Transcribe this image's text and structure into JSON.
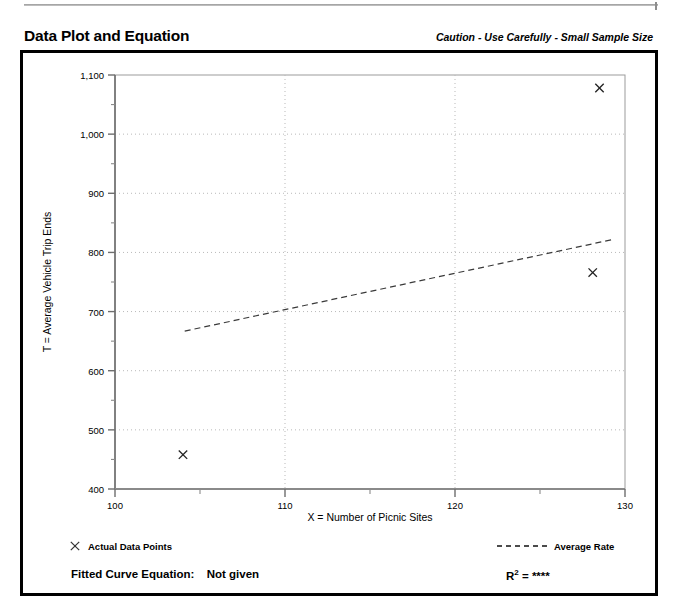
{
  "header": {
    "title": "Data Plot and Equation",
    "caution": "Caution - Use Carefully - Small Sample Size"
  },
  "footer": {
    "equation_label": "Fitted Curve Equation:",
    "equation_value": "Not given",
    "r2_symbol": "R",
    "r2_exponent": "2",
    "r2_equals": "=",
    "r2_value": "****"
  },
  "legend": {
    "data_points_label": "Actual Data Points",
    "data_points_marker": "x-marker-icon",
    "average_rate_label": "Average Rate",
    "average_rate_marker": "dashed-line-icon"
  },
  "chart_data": {
    "type": "scatter",
    "title": "Data Plot and Equation",
    "xlabel": "X = Number of Picnic Sites",
    "ylabel": "T = Average Vehicle Trip Ends",
    "xlim": [
      100,
      130
    ],
    "ylim": [
      400,
      1100
    ],
    "xticks": [
      100,
      110,
      120,
      130
    ],
    "xtick_labels": [
      "100",
      "110",
      "120",
      "130"
    ],
    "xminor_ticks": [
      105,
      115,
      125
    ],
    "yticks": [
      400,
      500,
      600,
      700,
      800,
      900,
      1000,
      1100
    ],
    "ytick_labels": [
      "400",
      "500",
      "600",
      "700",
      "800",
      "900",
      "1,000",
      "1,100"
    ],
    "yminor_ticks": [
      450,
      550,
      650,
      750,
      850,
      950,
      1050
    ],
    "grid": true,
    "grid_style": "dotted",
    "legend_position": "below-plot",
    "series": [
      {
        "name": "Actual Data Points",
        "type": "scatter",
        "marker": "x",
        "points": [
          {
            "x": 104.0,
            "y": 458
          },
          {
            "x": 128.5,
            "y": 1078
          },
          {
            "x": 128.1,
            "y": 766
          }
        ]
      },
      {
        "name": "Average Rate",
        "type": "line",
        "style": "dashed",
        "points": [
          {
            "x": 104.1,
            "y": 667
          },
          {
            "x": 129.3,
            "y": 822
          }
        ]
      }
    ]
  }
}
